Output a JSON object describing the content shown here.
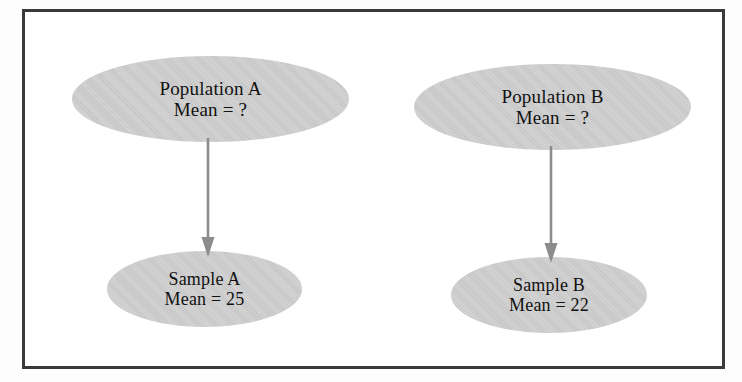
{
  "figure": {
    "background_color": "#ffffff",
    "frame_color": "#3a3a3a",
    "node_fill_color": "#c6c6c6",
    "arrow_color": "#8c8c8c",
    "text_color": "#111111"
  },
  "nodes": {
    "population_a": {
      "name": "Population A",
      "line1": "Population A",
      "line2": "Mean = ?",
      "mean_value": "?"
    },
    "population_b": {
      "name": "Population B",
      "line1": "Population B",
      "line2": "Mean = ?",
      "mean_value": "?"
    },
    "sample_a": {
      "name": "Sample A",
      "line1": "Sample A",
      "line2": "Mean = 25",
      "mean_value": "25"
    },
    "sample_b": {
      "name": "Sample B",
      "line1": "Sample B",
      "line2": "Mean = 22",
      "mean_value": "22"
    }
  },
  "arrows": [
    {
      "id": "arrow-a",
      "from": "population_a",
      "to": "sample_a",
      "direction": "down"
    },
    {
      "id": "arrow-b",
      "from": "population_b",
      "to": "sample_b",
      "direction": "down"
    }
  ]
}
